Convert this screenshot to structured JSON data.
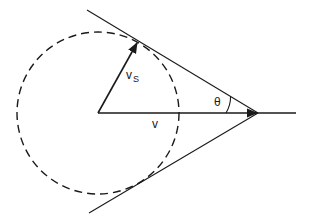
{
  "diagram": {
    "type": "velocity-cone-geometry",
    "colors": {
      "stroke": "#1a1a1a",
      "background": "#ffffff"
    },
    "circle": {
      "cx": 98,
      "cy": 113,
      "r": 81,
      "style": "dashed"
    },
    "apex": {
      "x": 258,
      "y": 113
    },
    "tangent_points": {
      "upper": {
        "x": 138,
        "y": 42
      },
      "lower": {
        "x": 136,
        "y": 184
      }
    },
    "labels": {
      "vs_main": "v",
      "vs_sub": "S",
      "v": "v",
      "theta": "θ"
    }
  }
}
